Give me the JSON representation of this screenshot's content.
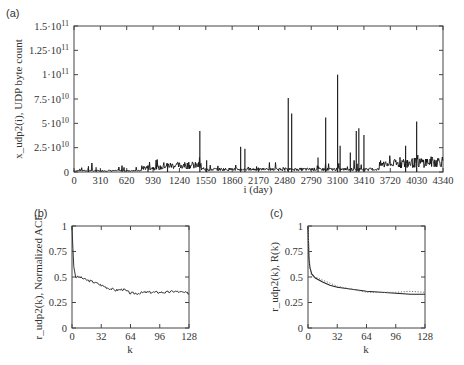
{
  "chart_data": [
    {
      "panel": "(a)",
      "type": "line",
      "title": "",
      "xlabel": "i (day)",
      "ylabel": "x_udp2(i), UDP byte count",
      "xlim": [
        0,
        4340
      ],
      "ylim": [
        0,
        150000000000
      ],
      "x_ticks": [
        "0",
        "310",
        "620",
        "930",
        "1240",
        "1550",
        "1860",
        "2170",
        "2480",
        "2790",
        "3100",
        "3410",
        "3720",
        "4030",
        "4340"
      ],
      "y_ticks": [
        "0",
        "2.5·10^10",
        "5·10^10",
        "7.5·10^10",
        "1·10^11",
        "1.25·10^11",
        "1.5·10^11"
      ],
      "grid": false,
      "baseline_approx": 3000000000,
      "spikes": [
        {
          "x": 170,
          "y": 6000000000
        },
        {
          "x": 260,
          "y": 5000000000
        },
        {
          "x": 870,
          "y": 7000000000
        },
        {
          "x": 1100,
          "y": 9000000000
        },
        {
          "x": 1480,
          "y": 42000000000
        },
        {
          "x": 1560,
          "y": 12000000000
        },
        {
          "x": 1960,
          "y": 26000000000
        },
        {
          "x": 2010,
          "y": 24000000000
        },
        {
          "x": 2520,
          "y": 76000000000
        },
        {
          "x": 2560,
          "y": 60000000000
        },
        {
          "x": 2870,
          "y": 15000000000
        },
        {
          "x": 2960,
          "y": 56000000000
        },
        {
          "x": 3100,
          "y": 100000000000
        },
        {
          "x": 3130,
          "y": 27000000000
        },
        {
          "x": 3250,
          "y": 20000000000
        },
        {
          "x": 3320,
          "y": 42000000000
        },
        {
          "x": 3350,
          "y": 45000000000
        },
        {
          "x": 3410,
          "y": 38000000000
        },
        {
          "x": 3900,
          "y": 27000000000
        },
        {
          "x": 4030,
          "y": 52000000000
        }
      ]
    },
    {
      "panel": "(b)",
      "type": "line",
      "title": "",
      "xlabel": "k",
      "ylabel": "r_udp2(k), Normalized ACF",
      "xlim": [
        0,
        128
      ],
      "ylim": [
        0,
        1
      ],
      "x_ticks": [
        "0",
        "32",
        "64",
        "96",
        "128"
      ],
      "y_ticks": [
        "0",
        "0.25",
        "0.5",
        "0.75",
        "1"
      ],
      "grid": false,
      "x": [
        0,
        1,
        2,
        4,
        8,
        16,
        24,
        32,
        40,
        48,
        56,
        64,
        72,
        80,
        88,
        96,
        104,
        112,
        120,
        128
      ],
      "values": [
        1.0,
        0.78,
        0.6,
        0.5,
        0.5,
        0.47,
        0.45,
        0.42,
        0.39,
        0.37,
        0.38,
        0.34,
        0.34,
        0.35,
        0.35,
        0.35,
        0.35,
        0.36,
        0.35,
        0.34
      ]
    },
    {
      "panel": "(c)",
      "type": "line",
      "title": "",
      "xlabel": "k",
      "ylabel": "r_udp2(k), R(k)",
      "xlim": [
        0,
        128
      ],
      "ylim": [
        0,
        1
      ],
      "x_ticks": [
        "0",
        "32",
        "64",
        "96",
        "128"
      ],
      "y_ticks": [
        "0",
        "0.25",
        "0.5",
        "0.75",
        "1"
      ],
      "grid": false,
      "series": [
        {
          "name": "R(k) model (solid)",
          "x": [
            0,
            1,
            2,
            4,
            8,
            16,
            24,
            32,
            48,
            64,
            80,
            96,
            112,
            128
          ],
          "values": [
            1.0,
            0.7,
            0.6,
            0.53,
            0.49,
            0.45,
            0.42,
            0.4,
            0.38,
            0.36,
            0.35,
            0.34,
            0.33,
            0.33
          ]
        },
        {
          "name": "r_udp2(k) empirical (dotted)",
          "x": [
            0,
            1,
            2,
            4,
            8,
            16,
            24,
            32,
            48,
            64,
            80,
            96,
            112,
            128
          ],
          "values": [
            1.0,
            0.78,
            0.6,
            0.5,
            0.5,
            0.47,
            0.44,
            0.41,
            0.38,
            0.35,
            0.35,
            0.35,
            0.36,
            0.35
          ]
        }
      ]
    }
  ],
  "labels": {
    "panel_a": "(a)",
    "panel_b": "(b)",
    "panel_c": "(c)",
    "a_xlabel": "i (day)",
    "a_ylabel": "x_udp2(i), UDP byte count",
    "b_xlabel": "k",
    "b_ylabel": "r_udp2(k), Normalized ACF",
    "c_xlabel": "k",
    "c_ylabel": "r_udp2(k),  R(k)"
  }
}
